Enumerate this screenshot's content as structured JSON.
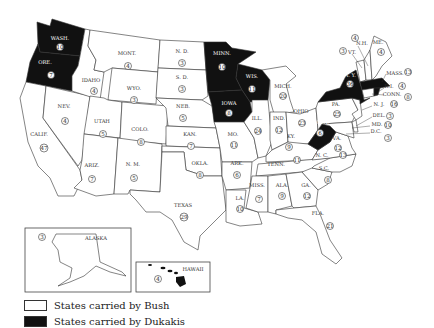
{
  "legend": {
    "bush_label": "States carried by Bush",
    "dukakis_label": "States carried by Dukakis",
    "bush_color": "#ffffff",
    "dukakis_color": "#111111"
  },
  "insets": {
    "alaska": {
      "label": "ALASKA",
      "ev": "3"
    },
    "hawaii": {
      "label": "HAWAII",
      "ev": "4"
    }
  },
  "states": {
    "wa": {
      "label": "WASH.",
      "ev": "10",
      "winner": "Dukakis"
    },
    "or": {
      "label": "ORE.",
      "ev": "7",
      "winner": "Dukakis"
    },
    "ca": {
      "label": "CALIF.",
      "ev": "47",
      "winner": "Bush"
    },
    "nv": {
      "label": "NEV.",
      "ev": "4",
      "winner": "Bush"
    },
    "id": {
      "label": "IDAHO",
      "ev": "4",
      "winner": "Bush"
    },
    "mt": {
      "label": "MONT.",
      "ev": "4",
      "winner": "Bush"
    },
    "wy": {
      "label": "WYO.",
      "ev": "3",
      "winner": "Bush"
    },
    "ut": {
      "label": "UTAH",
      "ev": "5",
      "winner": "Bush"
    },
    "az": {
      "label": "ARIZ.",
      "ev": "7",
      "winner": "Bush"
    },
    "co": {
      "label": "COLO.",
      "ev": "8",
      "winner": "Bush"
    },
    "nm": {
      "label": "N. M.",
      "ev": "5",
      "winner": "Bush"
    },
    "nd": {
      "label": "N. D.",
      "ev": "3",
      "winner": "Bush"
    },
    "sd": {
      "label": "S. D.",
      "ev": "3",
      "winner": "Bush"
    },
    "ne": {
      "label": "NEB.",
      "ev": "5",
      "winner": "Bush"
    },
    "ks": {
      "label": "KAN.",
      "ev": "7",
      "winner": "Bush"
    },
    "ok": {
      "label": "OKLA.",
      "ev": "8",
      "winner": "Bush"
    },
    "tx": {
      "label": "TEXAS",
      "ev": "29",
      "winner": "Bush"
    },
    "mn": {
      "label": "MINN.",
      "ev": "10",
      "winner": "Dukakis"
    },
    "ia": {
      "label": "IOWA",
      "ev": "8",
      "winner": "Dukakis"
    },
    "mo": {
      "label": "MO.",
      "ev": "11",
      "winner": "Bush"
    },
    "ar": {
      "label": "ARK.",
      "ev": "6",
      "winner": "Bush"
    },
    "la": {
      "label": "LA.",
      "ev": "10",
      "winner": "Bush"
    },
    "wi": {
      "label": "WIS.",
      "ev": "11",
      "winner": "Dukakis"
    },
    "il": {
      "label": "ILL.",
      "ev": "24",
      "winner": "Bush"
    },
    "mi": {
      "label": "MICH.",
      "ev": "20",
      "winner": "Bush"
    },
    "in": {
      "label": "IND.",
      "ev": "12",
      "winner": "Bush"
    },
    "oh": {
      "label": "OHIO",
      "ev": "23",
      "winner": "Bush"
    },
    "ky": {
      "label": "KY.",
      "ev": "9",
      "winner": "Bush"
    },
    "tn": {
      "label": "TENN.",
      "ev": "11",
      "winner": "Bush"
    },
    "ms": {
      "label": "MISS.",
      "ev": "7",
      "winner": "Bush"
    },
    "al": {
      "label": "ALA.",
      "ev": "9",
      "winner": "Bush"
    },
    "ga": {
      "label": "GA.",
      "ev": "12",
      "winner": "Bush"
    },
    "fl": {
      "label": "FLA.",
      "ev": "21",
      "winner": "Bush"
    },
    "sc": {
      "label": "S.C.",
      "ev": "8",
      "winner": "Bush"
    },
    "nc": {
      "label": "N. C.",
      "ev": "13",
      "winner": "Bush"
    },
    "va": {
      "label": "VA.",
      "ev": "12",
      "winner": "Bush"
    },
    "wv": {
      "label": "W. VA.",
      "ev": "6",
      "winner": "Dukakis"
    },
    "pa": {
      "label": "PA.",
      "ev": "25",
      "winner": "Bush"
    },
    "ny": {
      "label": "N. Y.",
      "ev": "36",
      "winner": "Dukakis"
    },
    "vt": {
      "label": "VT.",
      "ev": "3",
      "winner": "Bush"
    },
    "nh": {
      "label": "N.H.",
      "ev": "4",
      "winner": "Bush"
    },
    "me": {
      "label": "ME.",
      "ev": "4",
      "winner": "Bush"
    },
    "ma": {
      "label": "MASS.",
      "ev": "13",
      "winner": "Dukakis"
    },
    "ri": {
      "label": "R.I.",
      "ev": "4",
      "winner": "Dukakis"
    },
    "ct": {
      "label": "CONN.",
      "ev": "8",
      "winner": "Bush"
    },
    "nj": {
      "label": "N. J.",
      "ev": "16",
      "winner": "Bush"
    },
    "de": {
      "label": "DEL.",
      "ev": "3",
      "winner": "Bush"
    },
    "md": {
      "label": "MD.",
      "ev": "10",
      "winner": "Bush"
    },
    "dc": {
      "label": "D.C.",
      "ev": "3",
      "winner": "Dukakis"
    }
  }
}
